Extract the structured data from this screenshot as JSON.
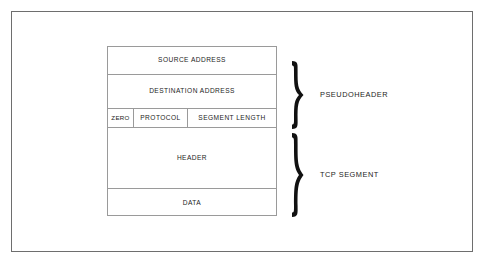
{
  "diagram": {
    "frame": {
      "border_color": "#6e6e6e"
    },
    "table": {
      "border_color": "#9a9a9a",
      "rows": [
        {
          "id": "source-address",
          "cells": [
            {
              "label": "SOURCE ADDRESS"
            }
          ]
        },
        {
          "id": "destination-address",
          "cells": [
            {
              "label": "DESTINATION ADDRESS"
            }
          ]
        },
        {
          "id": "split-row",
          "cells": [
            {
              "label": "ZERO"
            },
            {
              "label": "PROTOCOL"
            },
            {
              "label": "SEGMENT LENGTH"
            }
          ]
        },
        {
          "id": "header",
          "cells": [
            {
              "label": "HEADER"
            }
          ]
        },
        {
          "id": "data",
          "cells": [
            {
              "label": "DATA"
            }
          ]
        }
      ]
    },
    "groups": [
      {
        "id": "pseudoheader",
        "label": "PSEUDOHEADER",
        "covers": [
          "SOURCE ADDRESS",
          "DESTINATION ADDRESS",
          "ZERO",
          "PROTOCOL",
          "SEGMENT LENGTH"
        ],
        "brace_color": "#111111"
      },
      {
        "id": "tcp-segment",
        "label": "TCP SEGMENT",
        "covers": [
          "HEADER",
          "DATA"
        ],
        "brace_color": "#111111"
      }
    ]
  }
}
